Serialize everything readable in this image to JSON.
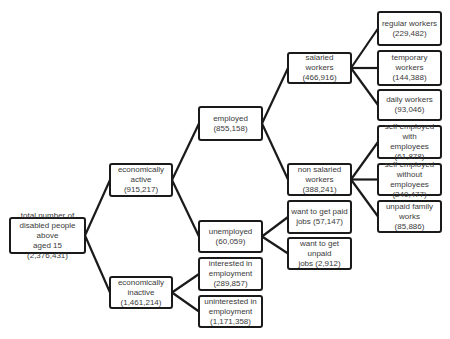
{
  "diagram": {
    "type": "tree",
    "nodes": {
      "total": {
        "label": "total number of disabled people above aged 15",
        "lines": [
          "total number of",
          "disabled people above",
          "aged 15 (2,376,431)"
        ],
        "value": "2,376,431"
      },
      "econ_active": {
        "label": "economically active",
        "lines": [
          "economically active",
          "(915,217)"
        ],
        "value": "915,217"
      },
      "econ_inactive": {
        "label": "economically inactive",
        "lines": [
          "economically",
          "inactive (1,461,214)"
        ],
        "value": "1,461,214"
      },
      "employed": {
        "label": "employed",
        "lines": [
          "employed",
          "(855,158)"
        ],
        "value": "855,158"
      },
      "unemployed": {
        "label": "unemployed",
        "lines": [
          "unemployed",
          "(60,059)"
        ],
        "value": "60,059"
      },
      "interested": {
        "label": "interested in employment",
        "lines": [
          "interested  in",
          "employment",
          "(289,857)"
        ],
        "value": "289,857"
      },
      "uninterested": {
        "label": "uninterested in employment",
        "lines": [
          "uninterested in",
          "employment",
          "(1,171,358)"
        ],
        "value": "1,171,358"
      },
      "salaried": {
        "label": "salaried workers",
        "lines": [
          "salaried workers",
          "(466,916)"
        ],
        "value": "466,916"
      },
      "non_salaried": {
        "label": "non salaried workers",
        "lines": [
          "non salaried",
          "workers (388,241)"
        ],
        "value": "388,241"
      },
      "want_paid": {
        "label": "want to get paid jobs",
        "lines": [
          "want to get paid",
          "jobs (57,147)"
        ],
        "value": "57,147"
      },
      "want_unpaid": {
        "label": "want to get unpaid jobs",
        "lines": [
          "want to get unpaid",
          "jobs (2,912)"
        ],
        "value": "2,912"
      },
      "regular": {
        "label": "regular workers",
        "lines": [
          "regular workers",
          "(229,482)"
        ],
        "value": "229,482"
      },
      "temporary": {
        "label": "temporary workers",
        "lines": [
          "temporary workers",
          "(144,388)"
        ],
        "value": "144,388"
      },
      "daily": {
        "label": "daily workers",
        "lines": [
          "daily workers",
          "(93,046)"
        ],
        "value": "93,046"
      },
      "self_with": {
        "label": "self employed with employees",
        "lines": [
          "self employed with",
          "employees (61,878)"
        ],
        "value": "61,878"
      },
      "self_without": {
        "label": "self employed without employees",
        "lines": [
          "self employed",
          "without employees",
          "(240,477)"
        ],
        "value": "240,477"
      },
      "unpaid_family": {
        "label": "unpaid family works",
        "lines": [
          "unpaid family works",
          "(85,886)"
        ],
        "value": "85,886"
      }
    },
    "edges": [
      [
        "total",
        "econ_active"
      ],
      [
        "total",
        "econ_inactive"
      ],
      [
        "econ_active",
        "employed"
      ],
      [
        "econ_active",
        "unemployed"
      ],
      [
        "econ_inactive",
        "interested"
      ],
      [
        "econ_inactive",
        "uninterested"
      ],
      [
        "employed",
        "salaried"
      ],
      [
        "employed",
        "non_salaried"
      ],
      [
        "unemployed",
        "want_paid"
      ],
      [
        "unemployed",
        "want_unpaid"
      ],
      [
        "salaried",
        "regular"
      ],
      [
        "salaried",
        "temporary"
      ],
      [
        "salaried",
        "daily"
      ],
      [
        "non_salaried",
        "self_with"
      ],
      [
        "non_salaried",
        "self_without"
      ],
      [
        "non_salaried",
        "unpaid_family"
      ]
    ],
    "colors": {
      "border": "#1a1a1a",
      "text": "#3a3a3a",
      "background": "#ffffff"
    }
  }
}
